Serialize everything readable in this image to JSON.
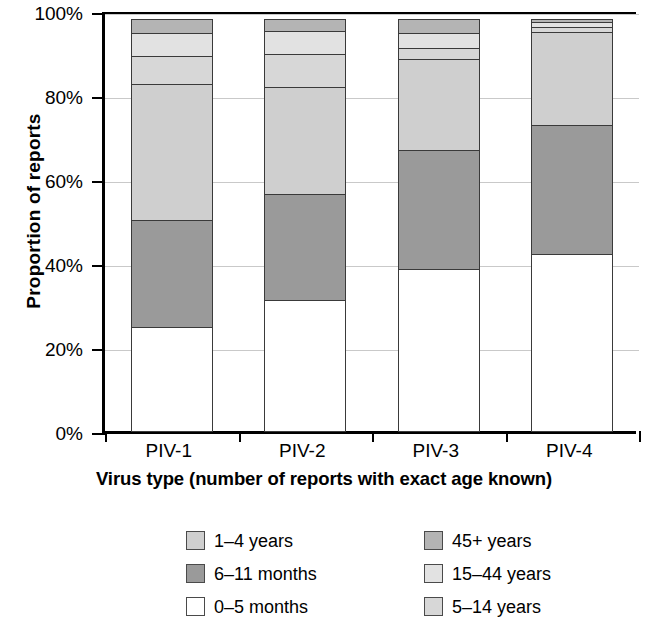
{
  "chart_data": {
    "type": "bar",
    "title": "",
    "subtitle": "",
    "stacked": true,
    "orientation": "vertical",
    "xlabel": "Virus type (number of reports with exact age known)",
    "ylabel": "Proportion of reports",
    "categories": [
      "PIV-1",
      "PIV-2",
      "PIV-3",
      "PIV-4"
    ],
    "ylim": [
      0,
      100
    ],
    "ytick_labels": [
      "0%",
      "20%",
      "40%",
      "60%",
      "80%",
      "100%"
    ],
    "ytick_values": [
      0,
      20,
      40,
      60,
      80,
      100
    ],
    "grid": "horizontal",
    "legend_position": "below-plot",
    "units": "percent",
    "series": [
      {
        "name": "0–5 months",
        "color": "#ffffff",
        "values": [
          25.0,
          31.5,
          39.0,
          42.5
        ]
      },
      {
        "name": "6–11 months",
        "color": "#9a9a9a",
        "values": [
          26.0,
          25.5,
          28.5,
          31.0
        ]
      },
      {
        "name": "1–4 years",
        "color": "#cfcfcf",
        "values": [
          32.5,
          26.0,
          22.0,
          22.5
        ]
      },
      {
        "name": "5–14 years",
        "color": "#d7d7d7",
        "values": [
          7.0,
          8.0,
          3.0,
          1.5
        ]
      },
      {
        "name": "15–44 years",
        "color": "#e2e2e2",
        "values": [
          6.0,
          6.0,
          4.0,
          1.5
        ]
      },
      {
        "name": "45+ years",
        "color": "#b4b4b4",
        "values": [
          3.5,
          3.0,
          3.5,
          1.0
        ]
      }
    ]
  },
  "legend": {
    "left_column": [
      {
        "label": "1–4 years",
        "color": "#cfcfcf"
      },
      {
        "label": "6–11 months",
        "color": "#9a9a9a"
      },
      {
        "label": "0–5 months",
        "color": "#ffffff"
      }
    ],
    "right_column": [
      {
        "label": "45+ years",
        "color": "#b4b4b4"
      },
      {
        "label": "15–44 years",
        "color": "#e2e2e2"
      },
      {
        "label": "5–14 years",
        "color": "#d7d7d7"
      }
    ]
  }
}
